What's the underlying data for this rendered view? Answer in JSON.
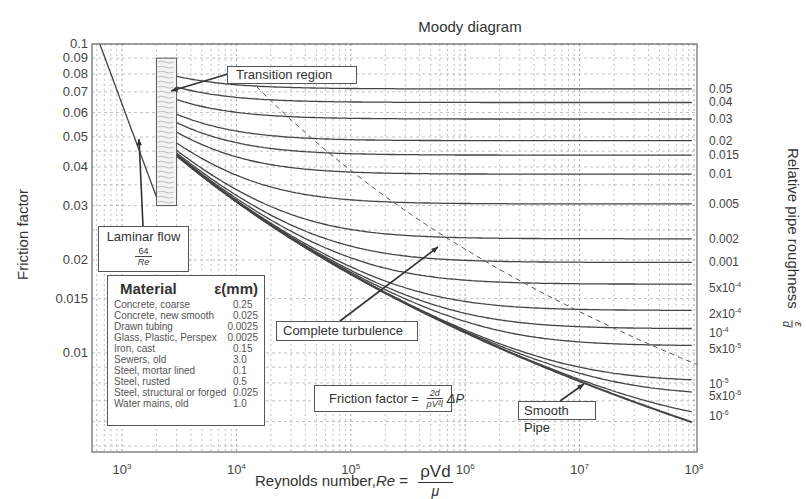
{
  "chart_data": {
    "type": "line",
    "title": "Moody diagram",
    "xlabel": "Reynolds number, Re = ρVd/μ",
    "xlabel_parts": {
      "prefix": "Reynolds number, ",
      "re": "Re",
      "eq": " = ",
      "numerator": "ρVd",
      "denominator": "μ"
    },
    "ylabel": "Friction factor",
    "y2label": "Relative pipe roughness",
    "y2label_frac": {
      "numerator": "ε",
      "denominator": "d"
    },
    "xscale": "log",
    "yscale": "log",
    "xlim": [
      600,
      100000000
    ],
    "ylim": [
      0.0048,
      0.1
    ],
    "grid": true,
    "x_ticks": [
      {
        "value": 1000,
        "base": "10",
        "exp": "3"
      },
      {
        "value": 10000,
        "base": "10",
        "exp": "4"
      },
      {
        "value": 100000,
        "base": "10",
        "exp": "5"
      },
      {
        "value": 1000000,
        "base": "10",
        "exp": "6"
      },
      {
        "value": 10000000,
        "base": "10",
        "exp": "7"
      },
      {
        "value": 100000000,
        "base": "10",
        "exp": "8"
      }
    ],
    "y_ticks": [
      {
        "value": 0.1,
        "label": "0.1"
      },
      {
        "value": 0.09,
        "label": "0.09"
      },
      {
        "value": 0.08,
        "label": "0.08"
      },
      {
        "value": 0.07,
        "label": "0.07"
      },
      {
        "value": 0.06,
        "label": "0.06"
      },
      {
        "value": 0.05,
        "label": "0.05"
      },
      {
        "value": 0.04,
        "label": "0.04"
      },
      {
        "value": 0.03,
        "label": "0.03"
      },
      {
        "value": 0.02,
        "label": "0.02"
      },
      {
        "value": 0.015,
        "label": "0.015"
      },
      {
        "value": 0.01,
        "label": "0.01"
      }
    ],
    "laminar_series": {
      "name": "Laminar flow",
      "formula": "f = 64/Re",
      "x_range": [
        640,
        2100
      ]
    },
    "transition_region": {
      "x_range": [
        2000,
        3000
      ],
      "y_range": [
        0.03,
        0.09
      ]
    },
    "complete_turbulence_line": {
      "style": "dashed"
    },
    "roughness_series": [
      {
        "name": "0.05",
        "rel_roughness": 0.05,
        "label": "0.05"
      },
      {
        "name": "0.04",
        "rel_roughness": 0.04,
        "label": "0.04"
      },
      {
        "name": "0.03",
        "rel_roughness": 0.03,
        "label": "0.03"
      },
      {
        "name": "0.02",
        "rel_roughness": 0.02,
        "label": "0.02"
      },
      {
        "name": "0.015",
        "rel_roughness": 0.015,
        "label": "0.015"
      },
      {
        "name": "0.01",
        "rel_roughness": 0.01,
        "label": "0.01"
      },
      {
        "name": "0.005",
        "rel_roughness": 0.005,
        "label": "0.005"
      },
      {
        "name": "0.002",
        "rel_roughness": 0.002,
        "label": "0.002"
      },
      {
        "name": "0.001",
        "rel_roughness": 0.001,
        "label": "0.001"
      },
      {
        "name": "5e-4",
        "rel_roughness": 0.0005,
        "label": "5x10",
        "exp": "-4"
      },
      {
        "name": "2e-4",
        "rel_roughness": 0.0002,
        "label": "2x10",
        "exp": "-4"
      },
      {
        "name": "1e-4",
        "rel_roughness": 0.0001,
        "label": "10",
        "exp": "-4"
      },
      {
        "name": "5e-5",
        "rel_roughness": 5e-05,
        "label": "5x10",
        "exp": "-5"
      },
      {
        "name": "1e-5",
        "rel_roughness": 1e-05,
        "label": "10",
        "exp": "-5"
      },
      {
        "name": "5e-6",
        "rel_roughness": 5e-06,
        "label": "5x10",
        "exp": "-6"
      },
      {
        "name": "1e-6",
        "rel_roughness": 1e-06,
        "label": "10",
        "exp": "-6"
      },
      {
        "name": "Smooth Pipe",
        "rel_roughness": 0,
        "label": ""
      }
    ]
  },
  "annotations": {
    "laminar": {
      "label": "Laminar flow",
      "numerator": "64",
      "denominator": "Re"
    },
    "transition": "Transition region",
    "complete_turbulence": "Complete turbulence",
    "smooth_pipe": "Smooth Pipe",
    "friction_factor": {
      "prefix": "Friction factor = ",
      "numerator": "2d",
      "denominator": "ρV²l",
      "suffix": "ΔP"
    }
  },
  "material_table": {
    "header_material": "Material",
    "header_eps": "ε(mm)",
    "rows": [
      {
        "material": "Concrete, coarse",
        "eps": "0.25"
      },
      {
        "material": "Concrete, new smooth",
        "eps": "0.025"
      },
      {
        "material": "Drawn tubing",
        "eps": "0.0025"
      },
      {
        "material": "Glass, Plastic, Perspex",
        "eps": "0.0025"
      },
      {
        "material": "Iron, cast",
        "eps": "0.15"
      },
      {
        "material": "Sewers, old",
        "eps": "3.0"
      },
      {
        "material": "Steel, mortar lined",
        "eps": "0.1"
      },
      {
        "material": "Steel, rusted",
        "eps": "0.5"
      },
      {
        "material": "Steel, structural or forged",
        "eps": "0.025"
      },
      {
        "material": "Water mains, old",
        "eps": "1.0"
      }
    ]
  }
}
